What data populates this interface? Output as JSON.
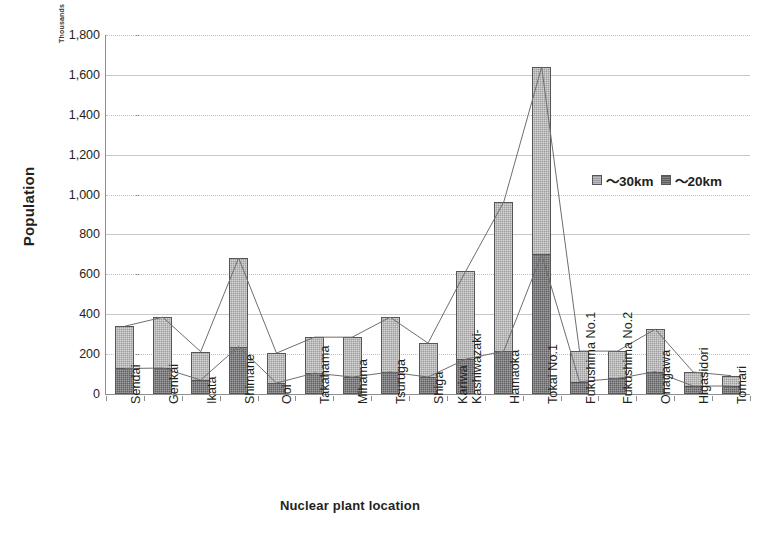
{
  "chart_data": {
    "type": "bar",
    "title": "",
    "subtitle": "",
    "xlabel": "Nuclear plant location",
    "ylabel": "Population",
    "units_note": "Thousands",
    "ylim": [
      0,
      1800
    ],
    "ytick_step": 200,
    "ytick_labels": [
      "0",
      "200",
      "400",
      "600",
      "800",
      "1,000",
      "1,200",
      "1,400",
      "1,600",
      "1,800"
    ],
    "ytick_values": [
      0,
      200,
      400,
      600,
      800,
      1000,
      1200,
      1400,
      1600,
      1800
    ],
    "grid": true,
    "legend_position": "inside-top-right",
    "stacked": true,
    "overlay_lines": true,
    "categories": [
      "Sendai",
      "Genkai",
      "Ikata",
      "Shimane",
      "Ooi",
      "Takahama",
      "Mihama",
      "Tsuruga",
      "Shiga",
      "Kashiwazaki-\nKariwa",
      "Hamaoka",
      "Tokai No.1",
      "Fukushima No.1",
      "Fukushima No.2",
      "Onagawa",
      "Higasidori",
      "Tomari"
    ],
    "series": [
      {
        "name": "～30km",
        "color": "#9d9d9d",
        "values": [
          340,
          385,
          212,
          682,
          205,
          285,
          285,
          385,
          255,
          617,
          963,
          1640,
          215,
          215,
          325,
          110,
          92
        ]
      },
      {
        "name": "～20km",
        "color": "#5f5f62",
        "values": [
          128,
          130,
          70,
          238,
          55,
          105,
          85,
          110,
          85,
          175,
          215,
          700,
          62,
          78,
          112,
          40,
          40
        ]
      }
    ]
  },
  "legend": {
    "entries": [
      {
        "label": "～30km",
        "swatch": "outer"
      },
      {
        "label": "～20km",
        "swatch": "inner"
      }
    ]
  },
  "axes": {
    "y_title": "Population",
    "x_title": "Nuclear plant location",
    "units_note": "Thousands"
  }
}
